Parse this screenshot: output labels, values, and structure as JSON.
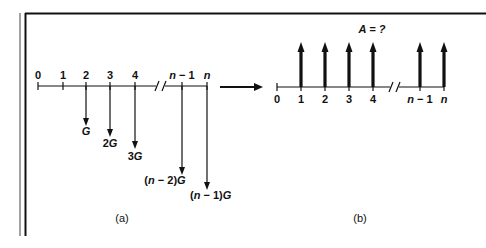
{
  "diagram": {
    "left": {
      "caption": "(a)",
      "ticks": [
        "0",
        "1",
        "2",
        "3",
        "4",
        "n − 1",
        "n"
      ],
      "cash_flows": [
        {
          "period": "2",
          "label": "G",
          "direction": "down"
        },
        {
          "period": "3",
          "label": "2G",
          "direction": "down"
        },
        {
          "period": "4",
          "label": "3G",
          "direction": "down"
        },
        {
          "period": "n − 1",
          "label": "(n − 2)G",
          "direction": "down"
        },
        {
          "period": "n",
          "label": "(n − 1)G",
          "direction": "down"
        }
      ]
    },
    "right": {
      "caption": "(b)",
      "title": "A = ?",
      "ticks": [
        "0",
        "1",
        "2",
        "3",
        "4",
        "n − 1",
        "n"
      ],
      "cash_flows": [
        {
          "period": "1",
          "direction": "up"
        },
        {
          "period": "2",
          "direction": "up"
        },
        {
          "period": "3",
          "direction": "up"
        },
        {
          "period": "4",
          "direction": "up"
        },
        {
          "period": "n − 1",
          "direction": "up"
        },
        {
          "period": "n",
          "direction": "up"
        }
      ]
    },
    "transform_arrow": "converts-to"
  }
}
